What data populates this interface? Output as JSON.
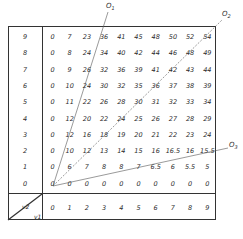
{
  "axes": {
    "row_axis_label": "v2",
    "col_axis_label": "v1",
    "row_labels": [
      "9",
      "8",
      "7",
      "6",
      "5",
      "4",
      "3",
      "2",
      "1",
      "0"
    ],
    "col_labels": [
      "0",
      "1",
      "2",
      "3",
      "4",
      "5",
      "6",
      "7",
      "8",
      "9"
    ]
  },
  "grid": [
    [
      "0",
      "7",
      "23",
      "36",
      "41",
      "45",
      "48",
      "50",
      "52",
      "54"
    ],
    [
      "0",
      "8",
      "24",
      "34",
      "40",
      "42",
      "44",
      "46",
      "48",
      "49"
    ],
    [
      "0",
      "9",
      "26",
      "32",
      "36",
      "39",
      "41",
      "42",
      "43",
      "44"
    ],
    [
      "0",
      "10",
      "24",
      "30",
      "32",
      "35",
      "36",
      "37",
      "38",
      "39"
    ],
    [
      "0",
      "11",
      "22",
      "26",
      "28",
      "30",
      "31",
      "32",
      "33",
      "34"
    ],
    [
      "0",
      "12",
      "20",
      "22",
      "24",
      "25",
      "26",
      "27",
      "28",
      "29"
    ],
    [
      "0",
      "12",
      "16",
      "18",
      "19",
      "20",
      "21",
      "22",
      "23",
      "24"
    ],
    [
      "0",
      "10",
      "12",
      "13",
      "14",
      "15",
      "16",
      "16.5",
      "16",
      "15.5"
    ],
    [
      "0",
      "6",
      "7",
      "8",
      "8",
      "7",
      "6.5",
      "6",
      "5.5",
      "5"
    ],
    [
      "0",
      "0",
      "0",
      "0",
      "0",
      "0",
      "0",
      "0",
      "0",
      "0"
    ]
  ],
  "rays": [
    {
      "label": "O1",
      "from": "origin",
      "to": "top, between columns 3 and 4"
    },
    {
      "label": "O2",
      "from": "origin",
      "to": "top-right corner"
    },
    {
      "label": "O3",
      "from": "origin",
      "to": "right edge, row 2"
    }
  ],
  "ray_labels": {
    "o1": "O",
    "o1_sub": "1",
    "o2": "O",
    "o2_sub": "2",
    "o3": "O",
    "o3_sub": "3"
  },
  "corner": {
    "top": "v2",
    "bottom": "v1"
  },
  "colors": {
    "line": "#333333",
    "text": "#2a2a2a",
    "ray": "#555555"
  }
}
